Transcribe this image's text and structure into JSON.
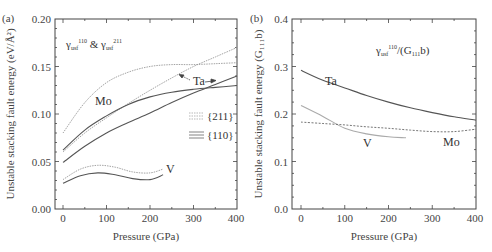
{
  "chart_data": [
    {
      "panel": "(a)",
      "type": "line",
      "title": "",
      "annotation": "γusf^110 & γusf^211",
      "xlabel": "Pressure (GPa)",
      "ylabel": "Unstable stacking fault energy (eV/Å²)",
      "xlim": [
        0,
        400
      ],
      "ylim": [
        0.0,
        0.2
      ],
      "xticks": [
        "0",
        "100",
        "200",
        "300",
        "400"
      ],
      "yticks": [
        "0.00",
        "0.05",
        "0.10",
        "0.15",
        "0.20"
      ],
      "legend": [
        {
          "label": "{211}",
          "style": "dotted"
        },
        {
          "label": "{110}",
          "style": "solid"
        }
      ],
      "legend_position": "right-middle",
      "curve_labels": [
        "Mo",
        "Ta",
        "V"
      ],
      "series": [
        {
          "name": "Mo {211}",
          "style": "dotted",
          "x": [
            0,
            50,
            100,
            150,
            200,
            250,
            300,
            350,
            400
          ],
          "values": [
            0.08,
            0.112,
            0.133,
            0.144,
            0.15,
            0.152,
            0.152,
            0.153,
            0.154
          ]
        },
        {
          "name": "Ta {211}",
          "style": "dotted",
          "x": [
            0,
            50,
            100,
            150,
            200,
            250,
            300,
            350,
            400
          ],
          "values": [
            0.06,
            0.08,
            0.096,
            0.111,
            0.125,
            0.138,
            0.15,
            0.16,
            0.17
          ]
        },
        {
          "name": "Mo {110}",
          "style": "solid",
          "x": [
            0,
            50,
            100,
            150,
            200,
            250,
            300,
            350,
            400
          ],
          "values": [
            0.062,
            0.083,
            0.098,
            0.11,
            0.118,
            0.123,
            0.126,
            0.128,
            0.13
          ]
        },
        {
          "name": "Ta {110}",
          "style": "solid",
          "x": [
            0,
            50,
            100,
            150,
            200,
            250,
            300,
            350,
            400
          ],
          "values": [
            0.049,
            0.066,
            0.08,
            0.091,
            0.101,
            0.112,
            0.122,
            0.131,
            0.14
          ]
        },
        {
          "name": "V {211}",
          "style": "dotted",
          "x": [
            0,
            40,
            80,
            120,
            160,
            200,
            230
          ],
          "values": [
            0.031,
            0.042,
            0.046,
            0.044,
            0.039,
            0.038,
            0.042
          ]
        },
        {
          "name": "V {110}",
          "style": "solid",
          "x": [
            0,
            40,
            80,
            120,
            160,
            200,
            230
          ],
          "values": [
            0.027,
            0.035,
            0.038,
            0.036,
            0.032,
            0.031,
            0.036
          ]
        }
      ]
    },
    {
      "panel": "(b)",
      "type": "line",
      "title": "",
      "annotation": "γusf^110/(G111 b)",
      "xlabel": "Pressure (GPa)",
      "ylabel": "Unstable stacking fault energy (G111 b)",
      "xlim": [
        0,
        400
      ],
      "ylim": [
        0.0,
        0.4
      ],
      "xticks": [
        "0",
        "100",
        "200",
        "300",
        "400"
      ],
      "yticks": [
        "0.0",
        "0.1",
        "0.2",
        "0.3",
        "0.4"
      ],
      "curve_labels": [
        "Ta",
        "V",
        "Mo"
      ],
      "series": [
        {
          "name": "Ta",
          "style": "solid",
          "x": [
            0,
            50,
            100,
            150,
            200,
            250,
            300,
            350,
            400
          ],
          "values": [
            0.292,
            0.271,
            0.255,
            0.239,
            0.225,
            0.213,
            0.203,
            0.194,
            0.187
          ]
        },
        {
          "name": "V",
          "style": "solid-light",
          "x": [
            0,
            50,
            100,
            150,
            200,
            240
          ],
          "values": [
            0.218,
            0.195,
            0.17,
            0.158,
            0.152,
            0.15
          ]
        },
        {
          "name": "Mo",
          "style": "dashed",
          "x": [
            0,
            50,
            100,
            150,
            200,
            250,
            300,
            350,
            400
          ],
          "values": [
            0.183,
            0.18,
            0.177,
            0.173,
            0.17,
            0.166,
            0.163,
            0.163,
            0.168
          ]
        }
      ]
    }
  ],
  "panel_a": {
    "label": "(a)",
    "ylabel": "Unstable stacking fault energy (eV/Å²)",
    "xlabel": "Pressure (GPa)",
    "annotation_main": "γ",
    "annotation_sub1": "usf",
    "annotation_sup1": "110",
    "annotation_amp": " & ",
    "annotation_sub2": "usf",
    "annotation_sup2": "211",
    "mo_label": "Mo",
    "ta_label": "Ta",
    "v_label": "V",
    "legend_211": "{211}",
    "legend_110": "{110}",
    "xticks": [
      "0",
      "100",
      "200",
      "300",
      "400"
    ],
    "yticks": [
      "0.00",
      "0.05",
      "0.10",
      "0.15",
      "0.20"
    ]
  },
  "panel_b": {
    "label": "(b)",
    "ylabel": "Unstable stacking fault energy (G₁₁₁b)",
    "xlabel": "Pressure (GPa)",
    "annotation_main": "γ",
    "annotation_sub": "usf",
    "annotation_sup": "110",
    "annotation_rest": "/(G",
    "annotation_sub2": "111",
    "annotation_end": "b)",
    "ta_label": "Ta",
    "v_label": "V",
    "mo_label": "Mo",
    "xticks": [
      "0",
      "100",
      "200",
      "300",
      "400"
    ],
    "yticks": [
      "0.0",
      "0.1",
      "0.2",
      "0.3",
      "0.4"
    ]
  },
  "colors": {
    "frame": "#444444",
    "dark_curve": "#555555",
    "light_curve": "#aaaaaa",
    "dotted_curve": "#888888"
  }
}
